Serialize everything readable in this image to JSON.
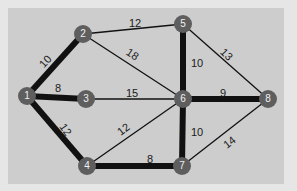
{
  "graph": {
    "colors": {
      "background": "#e6e6e6",
      "panel": "#cdcdcd",
      "node": "#5e5e5e",
      "node_text": "#f0f0f0",
      "edge": "#111111",
      "label": "#1a1a1a"
    },
    "nodes": [
      {
        "id": "1",
        "x": 27,
        "y": 96
      },
      {
        "id": "2",
        "x": 83,
        "y": 34
      },
      {
        "id": "3",
        "x": 86,
        "y": 99
      },
      {
        "id": "4",
        "x": 87,
        "y": 166
      },
      {
        "id": "5",
        "x": 183,
        "y": 24
      },
      {
        "id": "6",
        "x": 183,
        "y": 99
      },
      {
        "id": "7",
        "x": 182,
        "y": 166
      },
      {
        "id": "8",
        "x": 268,
        "y": 99
      }
    ],
    "edges": [
      {
        "from": "1",
        "to": "2",
        "weight": "10",
        "bold": true,
        "lx": 46,
        "ly": 62,
        "rot": -48
      },
      {
        "from": "1",
        "to": "3",
        "weight": "8",
        "bold": true,
        "lx": 58,
        "ly": 89,
        "rot": 0
      },
      {
        "from": "1",
        "to": "4",
        "weight": "12",
        "bold": true,
        "lx": 65,
        "ly": 130,
        "rot": 55
      },
      {
        "from": "2",
        "to": "5",
        "weight": "12",
        "bold": false,
        "lx": 135,
        "ly": 24,
        "rot": 0
      },
      {
        "from": "2",
        "to": "6",
        "weight": "18",
        "bold": false,
        "lx": 132,
        "ly": 55,
        "rot": 33
      },
      {
        "from": "3",
        "to": "6",
        "weight": "15",
        "bold": false,
        "lx": 132,
        "ly": 94,
        "rot": 0
      },
      {
        "from": "4",
        "to": "6",
        "weight": "12",
        "bold": false,
        "lx": 124,
        "ly": 130,
        "rot": -37
      },
      {
        "from": "4",
        "to": "7",
        "weight": "8",
        "bold": true,
        "lx": 150,
        "ly": 160,
        "rot": 0
      },
      {
        "from": "5",
        "to": "6",
        "weight": "10",
        "bold": true,
        "lx": 197,
        "ly": 64,
        "rot": 0
      },
      {
        "from": "5",
        "to": "8",
        "weight": "13",
        "bold": false,
        "lx": 226,
        "ly": 55,
        "rot": 45
      },
      {
        "from": "6",
        "to": "8",
        "weight": "9",
        "bold": true,
        "lx": 223,
        "ly": 94,
        "rot": 0
      },
      {
        "from": "6",
        "to": "7",
        "weight": "10",
        "bold": true,
        "lx": 197,
        "ly": 133,
        "rot": 0
      },
      {
        "from": "7",
        "to": "8",
        "weight": "14",
        "bold": false,
        "lx": 230,
        "ly": 143,
        "rot": -38
      }
    ]
  }
}
